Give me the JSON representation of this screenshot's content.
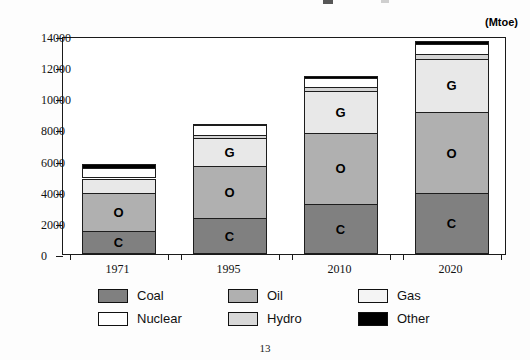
{
  "document": {
    "page_number": "13"
  },
  "chart_data": {
    "type": "bar",
    "subtype": "stacked",
    "title": "",
    "units_label": "(Mtoe)",
    "xlabel": "",
    "ylabel": "",
    "categories": [
      "1971",
      "1995",
      "2010",
      "2020"
    ],
    "ylim": [
      0,
      14000
    ],
    "yticks": [
      0,
      2000,
      4000,
      6000,
      8000,
      10000,
      12000,
      14000
    ],
    "ytick_labels": [
      "0",
      "2000",
      "4000",
      "6000",
      "8000",
      "10000",
      "12000",
      "14000"
    ],
    "grid": false,
    "legend_position": "bottom",
    "series": [
      {
        "name": "Coal",
        "key": "coal",
        "color": "#808080",
        "marker_letter": "C",
        "values": [
          1450,
          2300,
          3200,
          3900
        ]
      },
      {
        "name": "Oil",
        "key": "oil",
        "color": "#b0b0b0",
        "marker_letter": "O",
        "values": [
          2500,
          3350,
          4600,
          5200
        ]
      },
      {
        "name": "Gas",
        "key": "gas",
        "color": "#e8e8e8",
        "marker_letter": "G",
        "values": [
          900,
          1800,
          2650,
          3450
        ]
      },
      {
        "name": "Hydro",
        "key": "hydro",
        "color": "#d4d4d4",
        "marker_letter": "",
        "values": [
          120,
          200,
          250,
          300
        ]
      },
      {
        "name": "Nuclear",
        "key": "nuclear",
        "color": "#ffffff",
        "marker_letter": "",
        "values": [
          560,
          620,
          620,
          620
        ]
      },
      {
        "name": "Other",
        "key": "other",
        "color": "#000000",
        "marker_letter": "",
        "values": [
          220,
          80,
          130,
          230
        ]
      }
    ],
    "totals": [
      5000,
      8350,
      11450,
      13700
    ],
    "legend_entries": [
      {
        "label": "Coal",
        "color": "#808080"
      },
      {
        "label": "Oil",
        "color": "#b0b0b0"
      },
      {
        "label": "Gas",
        "color": "#f4f4f4"
      },
      {
        "label": "Nuclear",
        "color": "#ffffff"
      },
      {
        "label": "Hydro",
        "color": "#d8d8d8"
      },
      {
        "label": "Other",
        "color": "#000000"
      }
    ]
  }
}
